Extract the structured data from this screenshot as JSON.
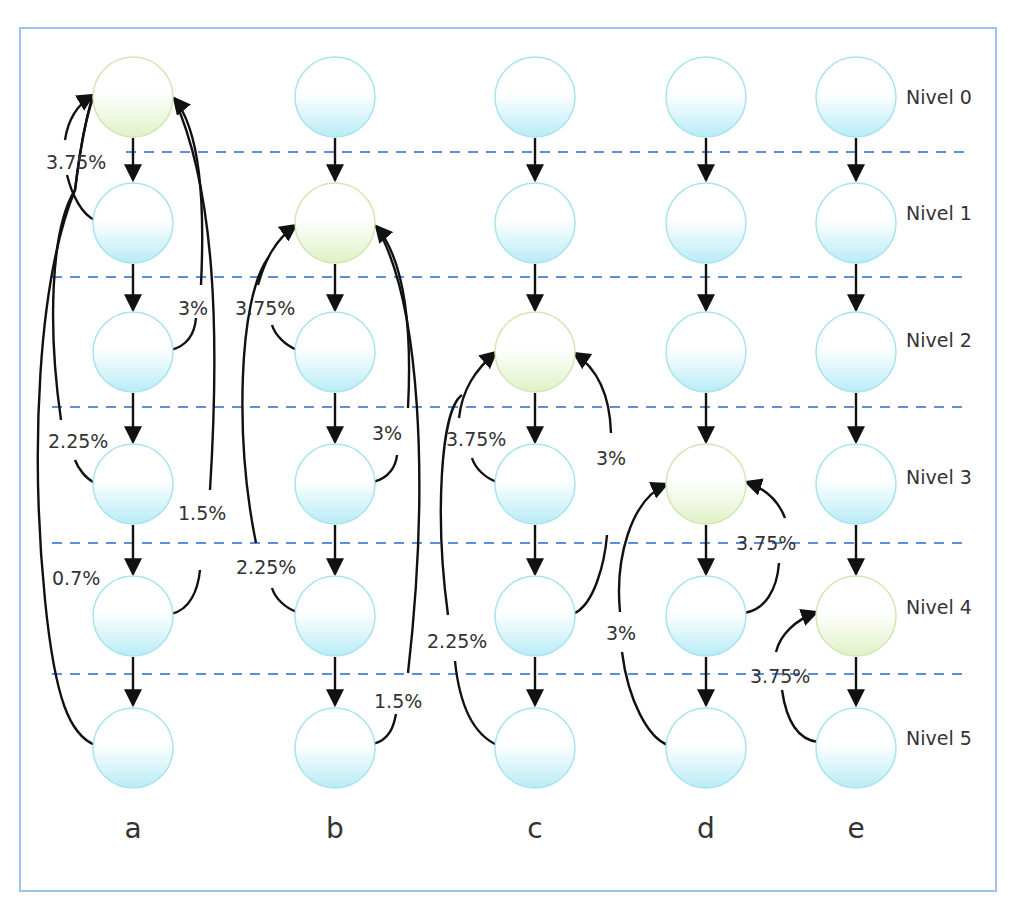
{
  "diagram": {
    "frame_color": "#9cc3ec",
    "level_line_color": "#5b8fd9",
    "node_colors": {
      "blue": "#bdeef6",
      "green": "#e3f2cc"
    },
    "levels": [
      "Nivel 0",
      "Nivel 1",
      "Nivel 2",
      "Nivel 3",
      "Nivel 4",
      "Nivel 5"
    ],
    "columns": [
      {
        "label": "a",
        "highlighted_level": 0,
        "transitions": [
          {
            "from_level": 1,
            "to_level": 0,
            "value": "3.75%"
          },
          {
            "from_level": 2,
            "to_level": 0,
            "value": "3%"
          },
          {
            "from_level": 3,
            "to_level": 0,
            "value": "2.25%"
          },
          {
            "from_level": 4,
            "to_level": 0,
            "value": "1.5%"
          },
          {
            "from_level": 5,
            "to_level": 0,
            "value": "0.7%"
          }
        ]
      },
      {
        "label": "b",
        "highlighted_level": 1,
        "transitions": [
          {
            "from_level": 2,
            "to_level": 1,
            "value": "3.75%"
          },
          {
            "from_level": 3,
            "to_level": 1,
            "value": "3%"
          },
          {
            "from_level": 4,
            "to_level": 1,
            "value": "2.25%"
          },
          {
            "from_level": 5,
            "to_level": 1,
            "value": "1.5%"
          }
        ]
      },
      {
        "label": "c",
        "highlighted_level": 2,
        "transitions": [
          {
            "from_level": 3,
            "to_level": 2,
            "value": "3.75%"
          },
          {
            "from_level": 4,
            "to_level": 2,
            "value": "3%"
          },
          {
            "from_level": 5,
            "to_level": 2,
            "value": "2.25%"
          }
        ]
      },
      {
        "label": "d",
        "highlighted_level": 3,
        "transitions": [
          {
            "from_level": 4,
            "to_level": 3,
            "value": "3.75%"
          },
          {
            "from_level": 5,
            "to_level": 3,
            "value": "3%"
          }
        ]
      },
      {
        "label": "e",
        "highlighted_level": 4,
        "transitions": [
          {
            "from_level": 5,
            "to_level": 4,
            "value": "3.75%"
          }
        ]
      }
    ]
  }
}
